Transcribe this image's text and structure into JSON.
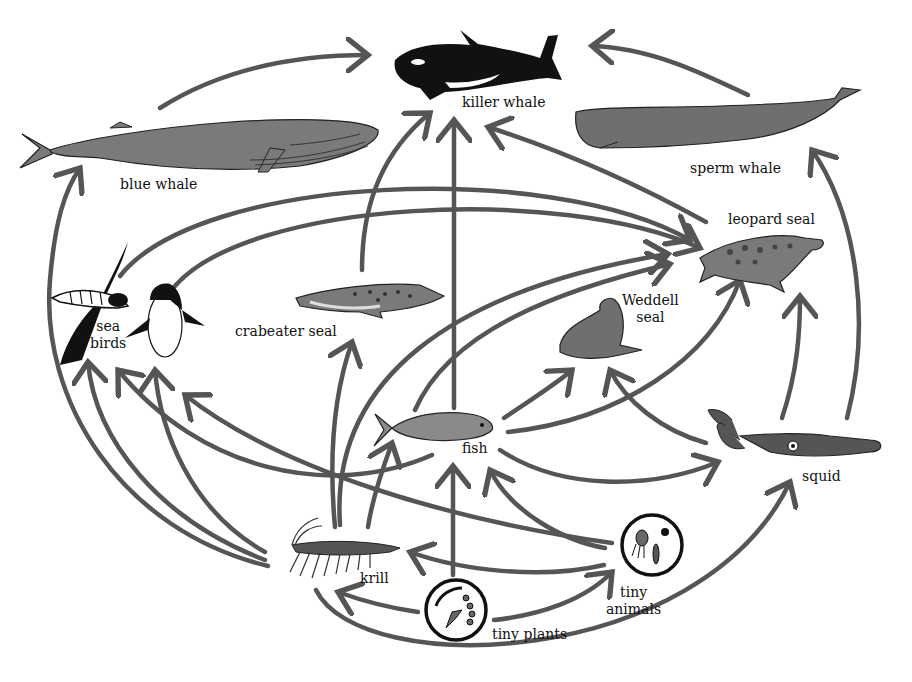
{
  "colors": {
    "arrow": "#555555",
    "animal_fill": "#7a7a7a",
    "dark_fill": "#111111",
    "background": "#ffffff"
  },
  "organisms": {
    "killer_whale": {
      "label": "killer whale"
    },
    "blue_whale": {
      "label": "blue whale"
    },
    "sperm_whale": {
      "label": "sperm whale"
    },
    "leopard_seal": {
      "label": "leopard seal"
    },
    "weddell_seal": {
      "label_line1": "Weddell",
      "label_line2": "seal"
    },
    "crabeater_seal": {
      "label": "crabeater seal"
    },
    "sea_birds": {
      "label_line1": "sea",
      "label_line2": "birds"
    },
    "fish": {
      "label": "fish"
    },
    "squid": {
      "label": "squid"
    },
    "krill": {
      "label": "krill"
    },
    "tiny_animals": {
      "label_line1": "tiny",
      "label_line2": "animals"
    },
    "tiny_plants": {
      "label": "tiny plants"
    }
  },
  "links": [
    {
      "from": "blue whale",
      "to": "killer whale"
    },
    {
      "from": "sperm whale",
      "to": "killer whale"
    },
    {
      "from": "crabeater seal",
      "to": "killer whale"
    },
    {
      "from": "fish",
      "to": "killer whale"
    },
    {
      "from": "leopard seal",
      "to": "killer whale"
    },
    {
      "from": "krill",
      "to": "blue whale"
    },
    {
      "from": "squid",
      "to": "sperm whale"
    },
    {
      "from": "sea birds",
      "to": "leopard seal"
    },
    {
      "from": "crabeater seal",
      "to": "leopard seal"
    },
    {
      "from": "krill",
      "to": "leopard seal"
    },
    {
      "from": "fish",
      "to": "leopard seal"
    },
    {
      "from": "squid",
      "to": "leopard seal"
    },
    {
      "from": "fish",
      "to": "Weddell seal"
    },
    {
      "from": "squid",
      "to": "Weddell seal"
    },
    {
      "from": "krill",
      "to": "crabeater seal"
    },
    {
      "from": "krill",
      "to": "sea birds"
    },
    {
      "from": "fish",
      "to": "sea birds"
    },
    {
      "from": "squid",
      "to": "sea birds"
    },
    {
      "from": "krill",
      "to": "fish"
    },
    {
      "from": "tiny animals",
      "to": "fish"
    },
    {
      "from": "tiny plants",
      "to": "fish"
    },
    {
      "from": "fish",
      "to": "squid"
    },
    {
      "from": "krill",
      "to": "squid"
    },
    {
      "from": "tiny animals",
      "to": "krill"
    },
    {
      "from": "tiny plants",
      "to": "krill"
    },
    {
      "from": "tiny plants",
      "to": "tiny animals"
    }
  ]
}
